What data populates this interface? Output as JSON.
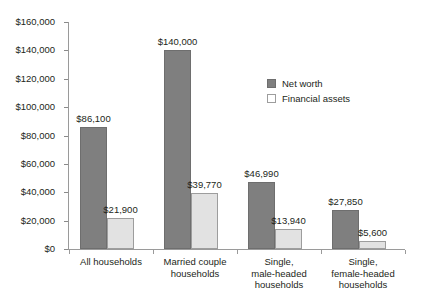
{
  "chart_data": {
    "type": "bar",
    "title": "",
    "subtitle": "",
    "xlabel": "",
    "ylabel": "",
    "grid": false,
    "legend_position": "inside-top-right",
    "ylim": [
      0,
      160000
    ],
    "ytick_values": [
      0,
      20000,
      40000,
      60000,
      80000,
      100000,
      120000,
      140000,
      160000
    ],
    "ytick_labels": [
      "$0",
      "$20,000",
      "$40,000",
      "$60,000",
      "$80,000",
      "$100,000",
      "$120,000",
      "$140,000",
      "$160,000"
    ],
    "categories": [
      "All households",
      "Married couple\nhouseholds",
      "Single,\nmale-headed\nhouseholds",
      "Single,\nfemale-headed\nhouseholds"
    ],
    "series": [
      {
        "name": "Net worth",
        "color": "#7f7f7f",
        "values": [
          86100,
          140000,
          46990,
          27850
        ],
        "value_labels": [
          "$86,100",
          "$140,000",
          "$46,990",
          "$27,850"
        ]
      },
      {
        "name": "Financial assets",
        "color": "#e2e2e2",
        "values": [
          21900,
          39770,
          13940,
          5600
        ],
        "value_labels": [
          "$21,900",
          "$39,770",
          "$13,940",
          "$5,600"
        ]
      }
    ]
  },
  "legend": {
    "items": [
      {
        "label": "Net worth",
        "swatch": "dark-gray"
      },
      {
        "label": "Financial assets",
        "swatch": "light-gray"
      }
    ]
  },
  "colors": {
    "net_worth": "#7f7f7f",
    "financial_assets": "#e2e2e2",
    "axis": "#9a9a9a",
    "text": "#231f20",
    "background": "#ffffff"
  }
}
